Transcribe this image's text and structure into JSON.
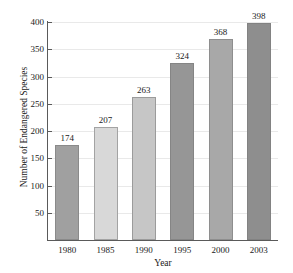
{
  "chart_data": {
    "type": "bar",
    "title": "",
    "xlabel": "Year",
    "ylabel": "Number of Endangered Species",
    "categories": [
      "1980",
      "1985",
      "1990",
      "1995",
      "2000",
      "2003"
    ],
    "values": [
      174,
      207,
      263,
      324,
      368,
      398
    ],
    "value_labels": [
      "174",
      "207",
      "263",
      "324",
      "368",
      "398"
    ],
    "bar_colors": [
      "#a0a0a0",
      "#d8d8d8",
      "#c6c6c6",
      "#969696",
      "#a8a8a8",
      "#8e8e8e"
    ],
    "ylim": [
      0,
      400
    ],
    "yticks": [
      50,
      100,
      150,
      200,
      250,
      300,
      350,
      400
    ],
    "ytick_labels": [
      "50",
      "100",
      "150",
      "200",
      "250",
      "300",
      "350",
      "400"
    ],
    "grid": true,
    "grid_axis": "y",
    "legend": null,
    "legend_position": "none",
    "orientation": "vertical",
    "series": [
      {
        "name": "Endangered Species",
        "values": [
          174,
          207,
          263,
          324,
          368,
          398
        ]
      }
    ]
  },
  "axes": {
    "spine_color": "#5a5a5a",
    "gridline_color": "#e9e9e9",
    "background": "#ffffff"
  }
}
